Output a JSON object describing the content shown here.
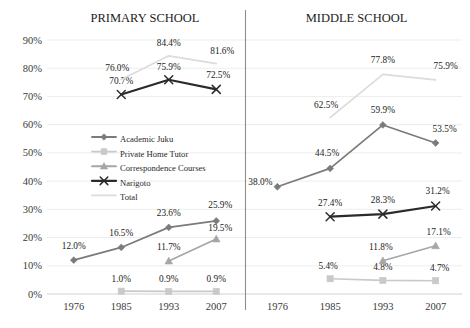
{
  "chart_data": {
    "type": "line",
    "title": "",
    "panels": [
      {
        "title": "PRIMARY SCHOOL",
        "categories": [
          "1976",
          "1985",
          "1993",
          "2007"
        ],
        "series": [
          {
            "name": "Academic Juku",
            "values": [
              12.0,
              16.5,
              23.6,
              25.9
            ],
            "labels": [
              "12.0%",
              "16.5%",
              "23.6%",
              "25.9%"
            ]
          },
          {
            "name": "Private Home Tutor",
            "values": [
              null,
              1.0,
              0.9,
              0.9
            ],
            "labels": [
              null,
              "1.0%",
              "0.9%",
              "0.9%"
            ]
          },
          {
            "name": "Correspondence Courses",
            "values": [
              null,
              null,
              11.7,
              19.5
            ],
            "labels": [
              null,
              null,
              "11.7%",
              "19.5%"
            ]
          },
          {
            "name": "Narigoto",
            "values": [
              null,
              70.7,
              75.9,
              72.5
            ],
            "labels": [
              null,
              "70.7%",
              "75.9%",
              "72.5%"
            ]
          },
          {
            "name": "Total",
            "values": [
              null,
              76.0,
              84.4,
              81.6
            ],
            "labels": [
              null,
              "76.0%",
              "84.4%",
              "81.6%"
            ]
          }
        ]
      },
      {
        "title": "MIDDLE SCHOOL",
        "categories": [
          "1976",
          "1985",
          "1993",
          "2007"
        ],
        "series": [
          {
            "name": "Academic Juku",
            "values": [
              38.0,
              44.5,
              59.9,
              53.5
            ],
            "labels": [
              "38.0%",
              "44.5%",
              "59.9%",
              "53.5%"
            ]
          },
          {
            "name": "Private Home Tutor",
            "values": [
              null,
              5.4,
              4.8,
              4.7
            ],
            "labels": [
              null,
              "5.4%",
              "4.8%",
              "4.7%"
            ]
          },
          {
            "name": "Correspondence Courses",
            "values": [
              null,
              null,
              11.8,
              17.1
            ],
            "labels": [
              null,
              null,
              "11.8%",
              "17.1%"
            ]
          },
          {
            "name": "Narigoto",
            "values": [
              null,
              27.4,
              28.3,
              31.2
            ],
            "labels": [
              null,
              "27.4%",
              "28.3%",
              "31.2%"
            ]
          },
          {
            "name": "Total",
            "values": [
              null,
              62.5,
              77.8,
              75.9
            ],
            "labels": [
              null,
              "62.5%",
              "77.8%",
              "75.9%"
            ]
          }
        ]
      }
    ],
    "ylim": [
      0,
      90
    ],
    "ytick_step": 10,
    "yticks": [
      "0%",
      "10%",
      "20%",
      "30%",
      "40%",
      "50%",
      "60%",
      "70%",
      "80%",
      "90%"
    ],
    "xlabel": "",
    "ylabel": "",
    "grid": true,
    "legend_position": "inside-left-panel",
    "legend": [
      {
        "label": "Academic Juku",
        "marker": "diamond",
        "color": "#7b7b7b"
      },
      {
        "label": "Private Home Tutor",
        "marker": "square",
        "color": "#c9c9c9"
      },
      {
        "label": "Correspondence Courses",
        "marker": "triangle",
        "color": "#a6a6a6"
      },
      {
        "label": "Narigoto",
        "marker": "x",
        "color": "#2b2b2b"
      },
      {
        "label": "Total",
        "marker": "none",
        "color": "#dcdcdc"
      }
    ],
    "series_colors": {
      "academic_juku": "#7b7b7b",
      "private_home_tutor": "#c9c9c9",
      "correspondence_courses": "#a6a6a6",
      "narigoto": "#2b2b2b",
      "total": "#dcdcdc"
    }
  }
}
